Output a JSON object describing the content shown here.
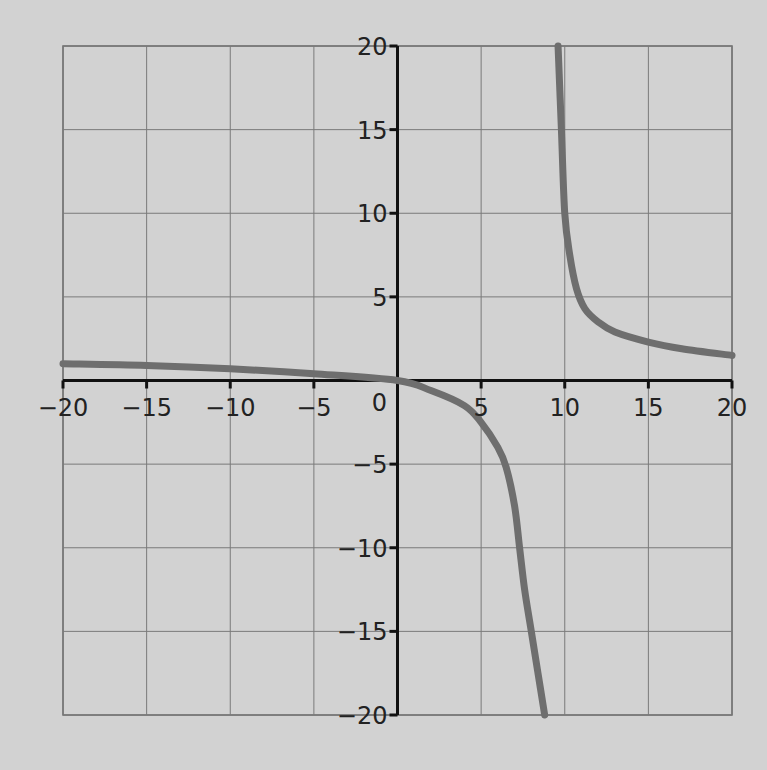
{
  "page": {
    "background": "#d2d2d2",
    "top_text_fragment": ""
  },
  "chart_data": {
    "type": "line",
    "title": "",
    "xlabel": "",
    "ylabel": "",
    "xlim": [
      -20,
      20
    ],
    "ylim": [
      -20,
      20
    ],
    "grid": true,
    "legend": null,
    "x_ticks": [
      -20,
      -15,
      -10,
      -5,
      0,
      5,
      10,
      15,
      20
    ],
    "y_ticks": [
      20,
      15,
      10,
      5,
      -5,
      -10,
      -15,
      -20
    ],
    "x_tick_labels": [
      "-20",
      "-15",
      "-10",
      "-5",
      "0",
      "5",
      "10",
      "15",
      "20"
    ],
    "y_tick_labels": [
      "20",
      "15",
      "10",
      "5",
      "-5",
      "-10",
      "-15",
      "-20"
    ],
    "origin_label": "0",
    "vertical_asymptote_approx": 8.9,
    "annotations": [],
    "series": [
      {
        "name": "f(x)",
        "color": "#6e6e6e",
        "branch": "left",
        "x": [
          -20,
          -15,
          -10,
          -5,
          0,
          2,
          4,
          5,
          6,
          6.5,
          7,
          7.3,
          7.6,
          8.0,
          8.4,
          8.8
        ],
        "y": [
          1.0,
          0.9,
          0.7,
          0.4,
          0,
          -0.6,
          -1.5,
          -2.5,
          -4.0,
          -5.2,
          -7.5,
          -10.0,
          -12.5,
          -15.0,
          -17.5,
          -20
        ]
      },
      {
        "name": "f(x)",
        "color": "#6e6e6e",
        "branch": "right",
        "x": [
          9.6,
          9.8,
          10.0,
          10.3,
          10.7,
          11.2,
          12.0,
          13.0,
          15.0,
          17.0,
          20.0
        ],
        "y": [
          20,
          15,
          10,
          7.5,
          5.5,
          4.3,
          3.5,
          2.9,
          2.3,
          1.9,
          1.5
        ]
      }
    ]
  }
}
